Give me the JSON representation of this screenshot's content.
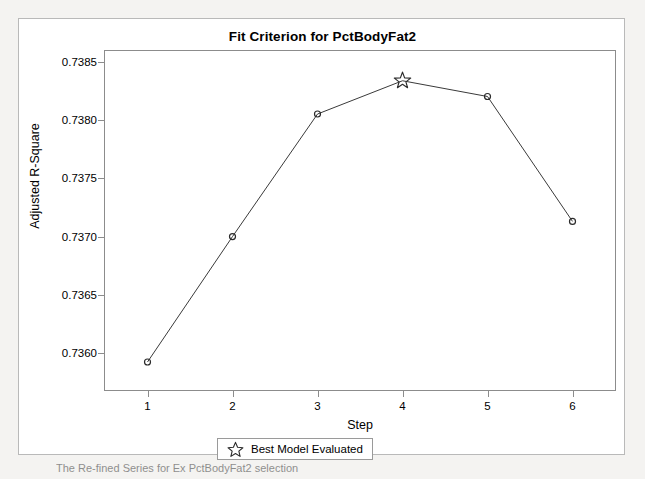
{
  "figure": {
    "title": "Fit Criterion for PctBodyFat2",
    "caption_fragment": "The Re-fined Series for Ex PctBodyFat2 selection"
  },
  "legend": {
    "icon": "star-icon",
    "label": "Best Model Evaluated"
  },
  "colors": {
    "line": "#3a3a3a",
    "marker": "#2b2b2b",
    "axis": "#8c8c8c",
    "panel_border": "#b9b9b9",
    "background": "#ffffff",
    "page": "#f4f3f1"
  },
  "chart_data": {
    "type": "line",
    "title": "Fit Criterion for PctBodyFat2",
    "xlabel": "Step",
    "ylabel": "Adjusted R-Square",
    "x": [
      1,
      2,
      3,
      4,
      5,
      6
    ],
    "values": [
      0.735925,
      0.737,
      0.73805,
      0.738335,
      0.7382,
      0.73713
    ],
    "xticks": [
      1,
      2,
      3,
      4,
      5,
      6
    ],
    "xtick_labels": [
      "1",
      "2",
      "3",
      "4",
      "5",
      "6"
    ],
    "yticks": [
      0.736,
      0.7365,
      0.737,
      0.7375,
      0.738,
      0.7385
    ],
    "ytick_labels": [
      "0.7360",
      "0.7365",
      "0.7370",
      "0.7375",
      "0.7380",
      "0.7385"
    ],
    "xlim": [
      0.5,
      6.5
    ],
    "ylim": [
      0.735685,
      0.73859
    ],
    "grid": false,
    "legend_position": "below-axes-center",
    "series": [
      {
        "name": "Adjusted R-Square",
        "marker": "circle",
        "values": [
          0.735925,
          0.737,
          0.73805,
          0.738335,
          0.7382,
          0.73713
        ]
      }
    ],
    "highlight": {
      "marker": "star",
      "label": "Best Model Evaluated",
      "x": 4,
      "y": 0.738335
    }
  }
}
